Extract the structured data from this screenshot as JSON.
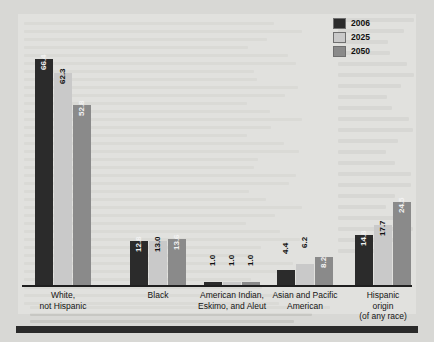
{
  "chart_data": {
    "type": "bar",
    "title": "",
    "subtitle": "",
    "xlabel": "",
    "ylabel": "",
    "ylim": [
      0,
      70
    ],
    "grid": false,
    "legend_position": "top-right",
    "categories": [
      "White,\nnot Hispanic",
      "Black",
      "American Indian,\nEskimo, and Aleut",
      "Asian and Pacific\nAmerican",
      "Hispanic\norigin\n(of any race)"
    ],
    "series": [
      {
        "name": "2006",
        "color": "#2b2b2b",
        "values": [
          66.4,
          12.8,
          1.0,
          4.4,
          14.8
        ]
      },
      {
        "name": "2025",
        "color": "#c9c9c9",
        "values": [
          62.3,
          13.0,
          1.0,
          6.2,
          17.7
        ]
      },
      {
        "name": "2050",
        "color": "#8a8a8a",
        "values": [
          52.8,
          13.6,
          1.0,
          8.2,
          24.5
        ]
      }
    ],
    "value_labels": [
      [
        "66.4",
        "62.3",
        "52.8"
      ],
      [
        "12.8",
        "13.0",
        "13.6"
      ],
      [
        "1.0",
        "1.0",
        "1.0"
      ],
      [
        "4.4",
        "6.2",
        "8.2"
      ],
      [
        "14.8",
        "17.7",
        "24.5"
      ]
    ]
  },
  "legend": {
    "items": [
      {
        "label": "2006",
        "color": "#2b2b2b"
      },
      {
        "label": "2025",
        "color": "#c9c9c9"
      },
      {
        "label": "2050",
        "color": "#8a8a8a"
      }
    ]
  },
  "colors": {
    "series_2006": "#2b2b2b",
    "series_2025": "#c9c9c9",
    "series_2050": "#8a8a8a",
    "axis": "#1f1f1f",
    "background": "#d8d8d5",
    "rule": "#2a2a2a"
  }
}
